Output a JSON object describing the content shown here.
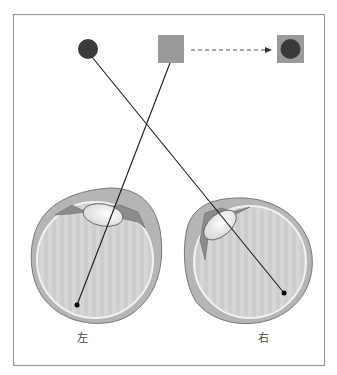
{
  "diagram": {
    "title": "",
    "objects": {
      "dark_circle": {
        "name": "dark circle",
        "color": "#3a3a3a"
      },
      "gray_square": {
        "name": "gray square",
        "color": "#9a9a9a"
      },
      "combined": {
        "name": "gray square with dark circle",
        "square_color": "#9a9a9a",
        "circle_color": "#3a3a3a"
      }
    },
    "arrow": {
      "style": "dashed",
      "meaning": "gray square becomes square with dark circle"
    },
    "eyes": [
      {
        "side": "left",
        "label": "左",
        "receives": "gray square"
      },
      {
        "side": "right",
        "label": "右",
        "receives": "dark circle"
      }
    ],
    "colors": {
      "frame": "#999999",
      "sclera": "#b9b9b9",
      "vitreous": "#cfcfcf",
      "lens": "#f4f4f4",
      "iris": "#8c8c8c",
      "ray": "#1a1a1a"
    }
  }
}
